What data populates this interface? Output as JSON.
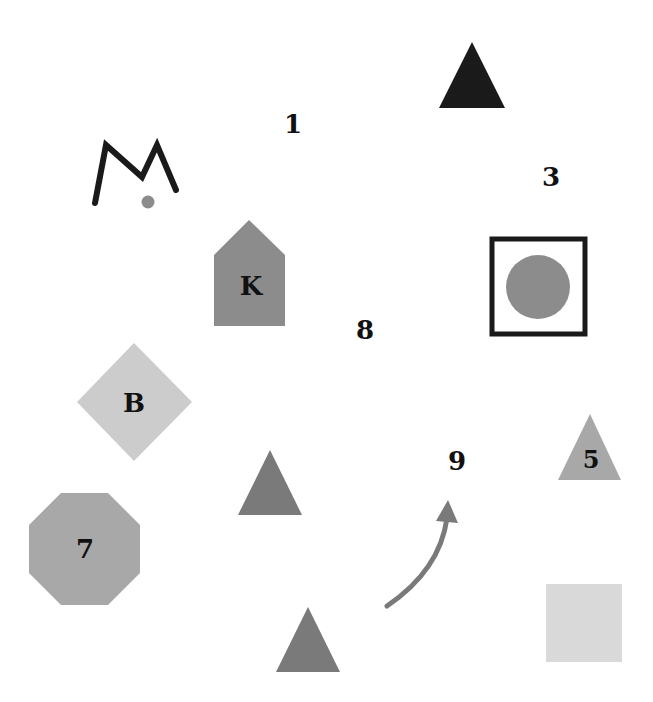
{
  "canvas": {
    "width": 653,
    "height": 702,
    "background": "#ffffff"
  },
  "labels": {
    "one": "1",
    "three": "3",
    "eight": "8",
    "nine": "9",
    "k": "K",
    "b": "B",
    "seven": "7",
    "five": "5"
  },
  "colors": {
    "black": "#1a1a1a",
    "dark_gray": "#7a7a7a",
    "mid_gray": "#8c8c8c",
    "light_gray": "#a8a8a8",
    "pale_gray": "#cccccc",
    "paler_gray": "#d9d9d9"
  },
  "shapes": [
    {
      "type": "triangle",
      "color": "black",
      "label": ""
    },
    {
      "type": "m-stroke-with-dot",
      "color": "black",
      "label": ""
    },
    {
      "type": "pentagon-house",
      "color": "mid_gray",
      "label": "K"
    },
    {
      "type": "square-outline-with-circle",
      "color": "black",
      "label": ""
    },
    {
      "type": "diamond",
      "color": "pale_gray",
      "label": "B"
    },
    {
      "type": "triangle",
      "color": "dark_gray",
      "label": ""
    },
    {
      "type": "octagon",
      "color": "light_gray",
      "label": "7"
    },
    {
      "type": "triangle",
      "color": "light_gray",
      "label": "5"
    },
    {
      "type": "curved-arrow",
      "color": "dark_gray",
      "label": ""
    },
    {
      "type": "triangle",
      "color": "dark_gray",
      "label": ""
    },
    {
      "type": "square",
      "color": "paler_gray",
      "label": ""
    }
  ]
}
